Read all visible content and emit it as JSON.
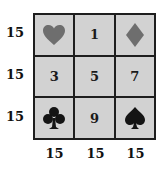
{
  "grid": {
    "cells": [
      {
        "type": "icon",
        "icon": "heart-icon",
        "color": "#6e6e6e"
      },
      {
        "type": "number",
        "value": "1"
      },
      {
        "type": "icon",
        "icon": "diamond-icon",
        "color": "#6e6e6e"
      },
      {
        "type": "number",
        "value": "3"
      },
      {
        "type": "number",
        "value": "5"
      },
      {
        "type": "number",
        "value": "7"
      },
      {
        "type": "icon",
        "icon": "club-icon",
        "color": "#141414"
      },
      {
        "type": "number",
        "value": "9"
      },
      {
        "type": "icon",
        "icon": "spade-icon",
        "color": "#141414"
      }
    ],
    "cell_bg": "#d2d2d2",
    "border_color": "#1e1e1e"
  },
  "row_sums": [
    "15",
    "15",
    "15"
  ],
  "col_sums": [
    "15",
    "15",
    "15"
  ]
}
